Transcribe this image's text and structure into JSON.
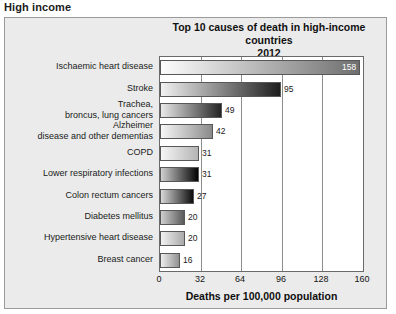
{
  "section": {
    "heading": "High income"
  },
  "chart_data": {
    "type": "bar",
    "orientation": "horizontal",
    "title": "Top 10 causes of death in high-income countries",
    "subtitle": "2012",
    "xlabel": "Deaths per 100,000 population",
    "ylabel": "",
    "xlim": [
      0,
      160
    ],
    "xticks": [
      0,
      32,
      64,
      96,
      128,
      160
    ],
    "xtick_labels": [
      "0",
      "32",
      "64",
      "96",
      "128",
      "160"
    ],
    "grid": true,
    "legend": "none",
    "categories": [
      "Ischaemic heart disease",
      "Stroke",
      "Trachea, broncus, lung cancers",
      "Alzheimer disease and other dementias",
      "COPD",
      "Lower respiratory infections",
      "Colon rectum cancers",
      "Diabetes mellitus",
      "Hypertensive heart disease",
      "Breast cancer"
    ],
    "category_lines": [
      [
        "Ischaemic heart disease"
      ],
      [
        "Stroke"
      ],
      [
        "Trachea,",
        "broncus, lung cancers"
      ],
      [
        "Alzheimer",
        "disease and other dementias"
      ],
      [
        "COPD"
      ],
      [
        "Lower respiratory infections"
      ],
      [
        "Colon rectum cancers"
      ],
      [
        "Diabetes mellitus"
      ],
      [
        "Hypertensive heart disease"
      ],
      [
        "Breast cancer"
      ]
    ],
    "values": [
      158,
      95,
      49,
      42,
      31,
      31,
      27,
      20,
      20,
      16
    ],
    "value_labels": [
      "158",
      "95",
      "49",
      "42",
      "31",
      "31",
      "27",
      "20",
      "20",
      "16"
    ],
    "bar_gradients": [
      [
        "#fdfdfd",
        "#6f6f6f"
      ],
      [
        "#f2f2f2",
        "#1d1d1d"
      ],
      [
        "#eaeaea",
        "#242424"
      ],
      [
        "#f7f7f7",
        "#8a8a8a"
      ],
      [
        "#f6f6f6",
        "#b4b4b4"
      ],
      [
        "#d0d0d0",
        "#030303"
      ],
      [
        "#d8d8d8",
        "#0d0d0d"
      ],
      [
        "#cfcfcf",
        "#5a5a5a"
      ],
      [
        "#f2f2f2",
        "#a9a9a9"
      ],
      [
        "#eeeeee",
        "#909090"
      ]
    ]
  },
  "colors": {
    "panel_background": "#ebebeb",
    "panel_border": "#9a9a9a",
    "plot_background": "#ffffff",
    "plot_border": "#6a6a6a",
    "gridline": "#8d8d8d",
    "text": "#1a1a1a"
  }
}
